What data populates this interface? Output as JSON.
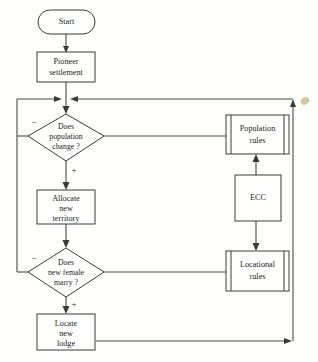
{
  "diagram": {
    "background_color": "#fffffd",
    "line_color": "#4a4a46",
    "text_color": "#23231f",
    "nodes": {
      "start": {
        "label": "Start",
        "shape": "terminator"
      },
      "pioneer": {
        "line1": "Pioneer",
        "line2": "settlement",
        "shape": "process"
      },
      "population_decision": {
        "line1": "Does",
        "line2": "population",
        "line3": "change ?",
        "shape": "decision",
        "negative_label": "−",
        "positive_label": "+"
      },
      "allocate": {
        "line1": "Allocate",
        "line2": "new",
        "line3": "territory",
        "shape": "process"
      },
      "female_decision": {
        "line1": "Does",
        "line2": "new female",
        "line3": "marry ?",
        "shape": "decision",
        "negative_label": "−",
        "positive_label": "+"
      },
      "locate_lodge": {
        "line1": "Locate",
        "line2": "new",
        "line3": "lodge",
        "shape": "process"
      },
      "population_rules": {
        "line1": "Population",
        "line2": "rules",
        "shape": "predefined-process"
      },
      "ecc": {
        "label": "ECC",
        "shape": "process"
      },
      "locational_rules": {
        "line1": "Locational",
        "line2": "rules",
        "shape": "predefined-process"
      }
    }
  }
}
